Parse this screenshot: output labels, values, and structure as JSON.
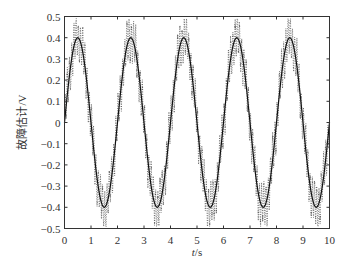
{
  "chart_data": {
    "type": "line",
    "title": "",
    "xlabel": "t/s",
    "xlabel_italic_part": "t",
    "xlabel_unit_part": "/s",
    "ylabel": "故障估计/V",
    "xlim": [
      0,
      10
    ],
    "ylim": [
      -0.5,
      0.5
    ],
    "xticks": [
      0,
      1,
      2,
      3,
      4,
      5,
      6,
      7,
      8,
      9,
      10
    ],
    "xtick_labels": [
      "0",
      "1",
      "2",
      "3",
      "4",
      "5",
      "6",
      "7",
      "8",
      "9",
      "10"
    ],
    "yticks": [
      0.5,
      0.4,
      0.3,
      0.2,
      0.1,
      0,
      -0.1,
      -0.2,
      -0.3,
      -0.4,
      -0.5
    ],
    "ytick_labels": [
      "0.5",
      "0.4",
      "0.3",
      "0.2",
      "0.1",
      "0",
      "−0.1",
      "−0.2",
      "−0.3",
      "−0.4",
      "−0.5"
    ],
    "grid": false,
    "legend": null,
    "series": [
      {
        "name": "actual fault",
        "style": "solid",
        "color": "#111111",
        "formula": "0.4*sin(pi*t)",
        "x": [
          0,
          0.25,
          0.5,
          0.75,
          1,
          1.25,
          1.5,
          1.75,
          2,
          2.25,
          2.5,
          2.75,
          3,
          3.25,
          3.5,
          3.75,
          4,
          4.25,
          4.5,
          4.75,
          5,
          5.25,
          5.5,
          5.75,
          6,
          6.25,
          6.5,
          6.75,
          7,
          7.25,
          7.5,
          7.75,
          8,
          8.25,
          8.5,
          8.75,
          9,
          9.25,
          9.5,
          9.75,
          10
        ],
        "values": [
          0,
          0.283,
          0.4,
          0.283,
          0,
          -0.283,
          -0.4,
          -0.283,
          0,
          0.283,
          0.4,
          0.283,
          0,
          -0.283,
          -0.4,
          -0.283,
          0,
          0.283,
          0.4,
          0.283,
          0,
          -0.283,
          -0.4,
          -0.283,
          0,
          0.283,
          0.4,
          0.283,
          0,
          -0.283,
          -0.4,
          -0.283,
          0,
          0.283,
          0.4,
          0.283,
          0,
          -0.283,
          -0.4,
          -0.283,
          0
        ]
      },
      {
        "name": "fault estimate",
        "style": "dotted",
        "color": "#333333",
        "description": "High-frequency oscillation around the actual fault, envelope approx ±0.1 about 0.4*sin(pi*t), peaks reaching about ±0.49",
        "base_formula": "0.4*sin(pi*t)",
        "ripple_amplitude": 0.09,
        "ripple_frequency_hz": 12,
        "envelope_max": 0.49,
        "envelope_min": -0.49
      }
    ]
  }
}
